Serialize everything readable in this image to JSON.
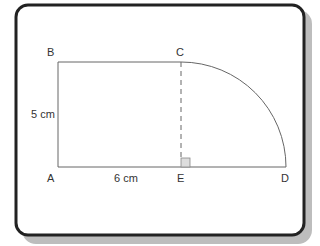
{
  "diagram": {
    "points": {
      "A": {
        "label": "A",
        "x": 58,
        "y": 167
      },
      "B": {
        "label": "B",
        "x": 58,
        "y": 62
      },
      "C": {
        "label": "C",
        "x": 181,
        "y": 62
      },
      "D": {
        "label": "D",
        "x": 286,
        "y": 167
      },
      "E": {
        "label": "E",
        "x": 181,
        "y": 167
      }
    },
    "labels": {
      "A": "A",
      "B": "B",
      "C": "C",
      "D": "D",
      "E": "E",
      "height": "5 cm",
      "width": "6 cm"
    },
    "colors": {
      "frame": "#222222",
      "shadow": "#bbbbbb",
      "line": "#666666",
      "right_angle_fill": "#dddddd"
    }
  }
}
